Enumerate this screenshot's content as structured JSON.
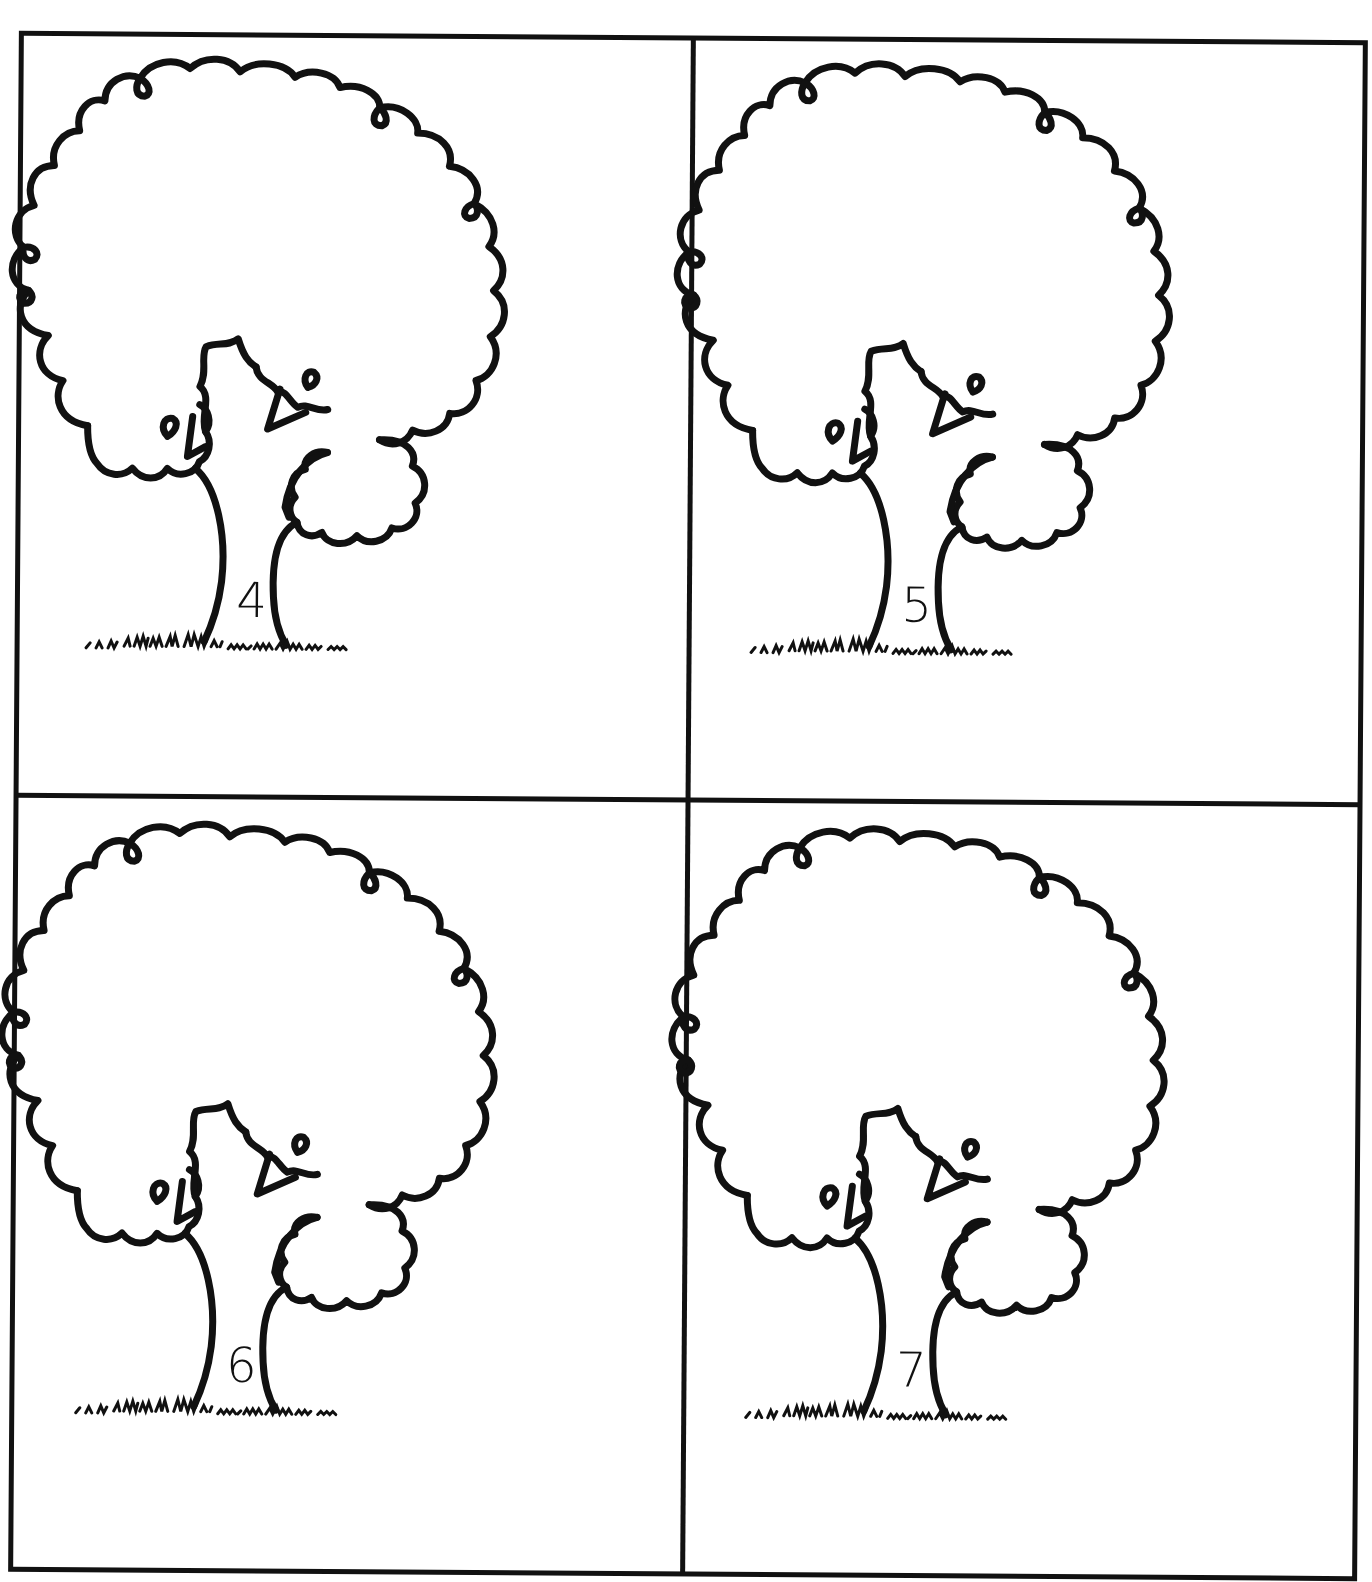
{
  "document": {
    "layout": "2x2 grid of tree cards",
    "colors": {
      "ink": "#111111",
      "paper": "#ffffff"
    },
    "cards": [
      {
        "position": "top-left",
        "image": "tree-outline",
        "number": "4"
      },
      {
        "position": "top-right",
        "image": "tree-outline",
        "number": "5"
      },
      {
        "position": "bottom-left",
        "image": "tree-outline",
        "number": "6"
      },
      {
        "position": "bottom-right",
        "image": "tree-outline",
        "number": "7"
      }
    ]
  }
}
